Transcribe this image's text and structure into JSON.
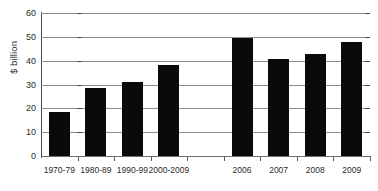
{
  "chart_data": {
    "type": "bar",
    "title": "",
    "subtitle": "",
    "xlabel": "",
    "ylabel": "$ billion",
    "ylim": [
      0,
      60
    ],
    "yticks": [
      0,
      10,
      20,
      30,
      40,
      50,
      60
    ],
    "ytick_labels": [
      "0",
      "10",
      "20",
      "30",
      "40",
      "50",
      "60"
    ],
    "grid": true,
    "legend": null,
    "legend_position": "none",
    "categories": [
      "1970-79",
      "1980-89",
      "1990-99",
      "2000-2009",
      "",
      "2006",
      "2007",
      "2008",
      "2009"
    ],
    "values": [
      18.5,
      28.7,
      31.0,
      38.0,
      null,
      49.5,
      40.5,
      43.0,
      48.0
    ],
    "series": [
      {
        "name": "",
        "color": "#0a0a0a",
        "values": [
          18.5,
          28.7,
          31.0,
          38.0,
          null,
          49.5,
          40.5,
          43.0,
          48.0
        ]
      }
    ],
    "annotations": [],
    "bar_color": "#0a0a0a",
    "gridline_color": "#8d8d8d",
    "axis_color": "#4a4a4a",
    "background_color": "#ffffff"
  }
}
